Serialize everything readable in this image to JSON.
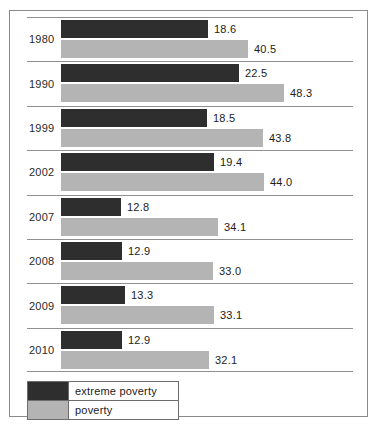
{
  "chart_data": {
    "type": "bar",
    "orientation": "horizontal",
    "title": "",
    "xlabel": "",
    "ylabel": "",
    "grid": true,
    "legend_position": "bottom-left",
    "categories": [
      "1980",
      "1990",
      "1999",
      "2002",
      "2007",
      "2008",
      "2009",
      "2010"
    ],
    "series": [
      {
        "name": "extreme poverty",
        "color": "#2e2e2e",
        "values": [
          18.6,
          22.5,
          18.5,
          19.4,
          12.8,
          12.9,
          13.3,
          12.9
        ],
        "labels": [
          "18.6",
          "22.5",
          "18.5",
          "19.4",
          "12.8",
          "12.9",
          "13.3",
          "12.9"
        ],
        "bar_px": [
          147,
          178,
          146,
          153,
          60,
          61,
          64,
          61
        ]
      },
      {
        "name": "poverty",
        "color": "#b4b4b4",
        "values": [
          40.5,
          48.3,
          43.8,
          44.0,
          34.1,
          33.0,
          33.1,
          32.1
        ],
        "labels": [
          "40.5",
          "48.3",
          "43.8",
          "44.0",
          "34.1",
          "33.0",
          "33.1",
          "32.1"
        ],
        "bar_px": [
          187,
          223,
          202,
          203,
          157,
          152,
          153,
          148
        ]
      }
    ]
  },
  "legend": {
    "items": [
      {
        "label": "extreme poverty",
        "color": "#2e2e2e"
      },
      {
        "label": "poverty",
        "color": "#b4b4b4"
      }
    ]
  }
}
